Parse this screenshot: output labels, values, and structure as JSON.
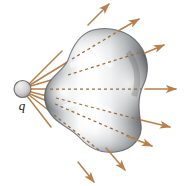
{
  "figure": {
    "background_color": "#ffffff",
    "width": 187,
    "height": 186
  },
  "charge": {
    "label": "q",
    "shape": "sphere",
    "cx": 22.5,
    "cy": 89,
    "r": 8.5,
    "fill_light": "#e8e8e8",
    "fill_dark": "#9a9a9a",
    "outline_color": "#6d6d6d"
  },
  "surface": {
    "name": "gaussian-surface",
    "description": "irregular closed blob surface, shaded gray 3D",
    "fill_light": "#ffffff",
    "fill_mid": "#b9bcbe",
    "fill_dark": "#5d6164",
    "outline_color": "#55585b",
    "path": "M 93 30 C 108 26, 128 30, 139 44 C 150 58, 149 74, 143 86 C 137 98, 139 112, 141 124 C 143 137, 133 150, 116 152 C 100 154, 88 147, 80 138 C 72 129, 62 126, 54 118 C 45 109, 42 97, 47 86 C 52 75, 64 70, 68 60 C 72 48, 79 34, 93 30 Z"
  },
  "rays": {
    "color": "#b8804a",
    "shaft_highlight": "#e0b48a",
    "head_color": "#b8804a",
    "dash_pattern": "3,3",
    "count": 8,
    "items": [
      {
        "id": "ray-1",
        "angle_deg": -47,
        "x1": 29,
        "y1": 84,
        "x2": 109,
        "y2": 4,
        "enter_t": 0.41,
        "exit_t": 0.74
      },
      {
        "id": "ray-2",
        "angle_deg": -33,
        "x1": 30,
        "y1": 85,
        "x2": 139,
        "y2": 19,
        "enter_t": 0.4,
        "exit_t": 0.8
      },
      {
        "id": "ray-3",
        "angle_deg": -17,
        "x1": 31,
        "y1": 86,
        "x2": 164,
        "y2": 45,
        "enter_t": 0.3,
        "exit_t": 0.82
      },
      {
        "id": "ray-4",
        "angle_deg": 0,
        "x1": 31,
        "y1": 89,
        "x2": 176,
        "y2": 89,
        "enter_t": 0.14,
        "exit_t": 0.77
      },
      {
        "id": "ray-5",
        "angle_deg": 15,
        "x1": 31,
        "y1": 92,
        "x2": 170,
        "y2": 127,
        "enter_t": 0.2,
        "exit_t": 0.77
      },
      {
        "id": "ray-6",
        "angle_deg": 29,
        "x1": 30,
        "y1": 94,
        "x2": 152,
        "y2": 146,
        "enter_t": 0.22,
        "exit_t": 0.8
      },
      {
        "id": "ray-7",
        "angle_deg": 42,
        "x1": 29,
        "y1": 95,
        "x2": 125,
        "y2": 170,
        "enter_t": 0.28,
        "exit_t": 0.8
      },
      {
        "id": "ray-8",
        "angle_deg": 56,
        "x1": 27,
        "y1": 96,
        "x2": 94,
        "y2": 182,
        "enter_t": 0.36,
        "exit_t": 0.74
      }
    ]
  }
}
